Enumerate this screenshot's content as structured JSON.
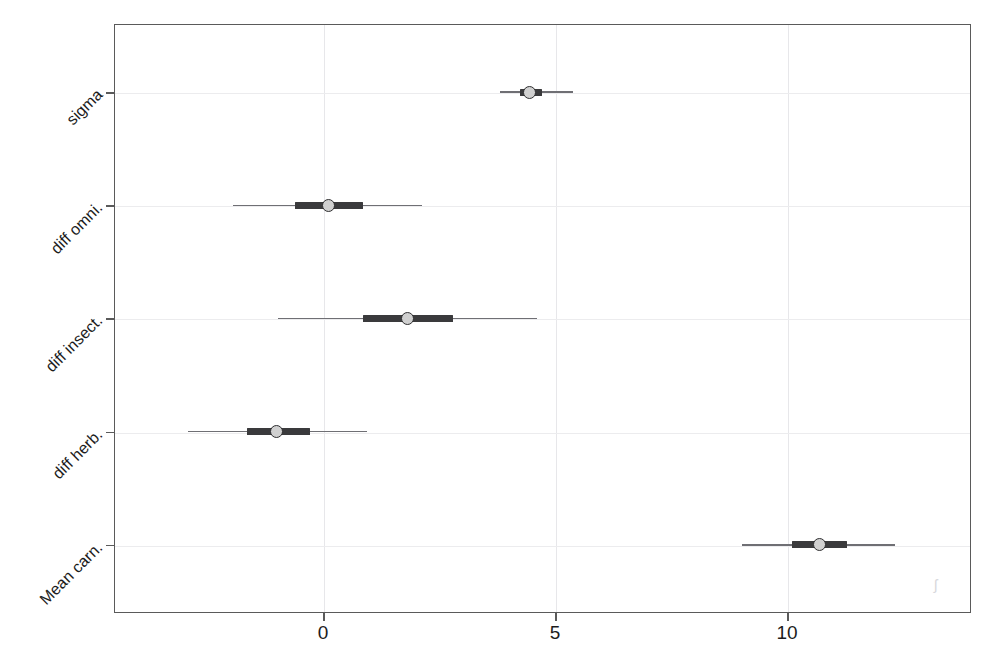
{
  "chart_data": {
    "type": "bar",
    "subtype": "interval-plot",
    "title": "",
    "subtitle": "",
    "xlabel": "",
    "ylabel": "",
    "xlim": [
      -3.8,
      13.0
    ],
    "ylim": [
      0,
      5
    ],
    "grid": true,
    "legend": null,
    "xticks": [
      {
        "label": "0",
        "value": 0
      },
      {
        "label": "5",
        "value": 5
      },
      {
        "label": "10",
        "value": 10
      }
    ],
    "categories": [
      "sigma",
      "diff omni.",
      "diff insect.",
      "diff herb.",
      "Mean carn."
    ],
    "series": [
      {
        "name": "posterior interval",
        "points": [
          {
            "category": "sigma",
            "estimate": 4.46,
            "inner_low": 4.24,
            "inner_high": 4.72,
            "outer_low": 3.82,
            "outer_high": 5.39
          },
          {
            "category": "diff omni.",
            "estimate": 0.11,
            "inner_low": -0.6,
            "inner_high": 0.86,
            "outer_low": -1.94,
            "outer_high": 2.13
          },
          {
            "category": "diff insect.",
            "estimate": 1.83,
            "inner_low": 0.86,
            "inner_high": 2.8,
            "outer_low": -0.97,
            "outer_high": 4.61
          },
          {
            "category": "diff herb.",
            "estimate": -1.01,
            "inner_low": -1.64,
            "inner_high": -0.28,
            "outer_low": -2.91,
            "outer_high": 0.95
          },
          {
            "category": "Mean carn.",
            "estimate": 10.71,
            "inner_low": 10.11,
            "inner_high": 11.29,
            "outer_low": 9.03,
            "outer_high": 12.33
          }
        ]
      }
    ],
    "colors": {
      "point_fill": "#d0d0d0",
      "point_stroke": "#2f2f31",
      "inner_bar": "#3a3a3c",
      "outer_line": "#6f6f74",
      "grid": "#e7e7ea",
      "frame": "#5a5a5a",
      "background": "#ffffff"
    }
  },
  "artifact": {
    "smudge_mark": "ʃ"
  }
}
